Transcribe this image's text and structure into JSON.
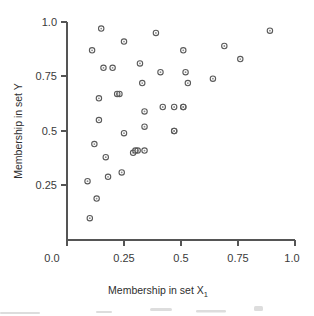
{
  "chart_data": {
    "type": "scatter",
    "title": "",
    "xlabel": "Membership in set X",
    "xlabel_subscript": "1",
    "ylabel": "Membership in set Y",
    "xlim": [
      0.0,
      1.0
    ],
    "ylim": [
      0.0,
      1.0
    ],
    "grid": false,
    "legend": null,
    "xticks": [
      0.0,
      0.25,
      0.5,
      0.75,
      1.0
    ],
    "xtick_labels": [
      "0.0",
      "0.25",
      "0.5",
      "0.75",
      "1.0"
    ],
    "yticks": [
      0.25,
      0.5,
      0.75,
      1.0
    ],
    "ytick_labels": [
      "0.25",
      "0.5",
      "0.75",
      "1.0"
    ],
    "marker": "open-circle",
    "marker_color": "#5a5a5a",
    "n_points": 40,
    "x": [
      0.11,
      0.09,
      0.15,
      0.16,
      0.14,
      0.22,
      0.25,
      0.25,
      0.24,
      0.32,
      0.33,
      0.34,
      0.34,
      0.34,
      0.31,
      0.39,
      0.41,
      0.42,
      0.46,
      0.47,
      0.51,
      0.52,
      0.53,
      0.54,
      0.64,
      0.69,
      0.76,
      0.89,
      0.12,
      0.14,
      0.1,
      0.13,
      0.17,
      0.18,
      0.2,
      0.23,
      0.29,
      0.3,
      0.47,
      0.51
    ],
    "y": [
      0.87,
      0.27,
      0.97,
      0.79,
      0.65,
      0.67,
      0.91,
      0.49,
      0.31,
      0.81,
      0.72,
      0.59,
      0.52,
      0.41,
      0.41,
      0.95,
      0.77,
      0.61,
      0.61,
      0.5,
      0.87,
      0.77,
      0.72,
      0.61,
      0.74,
      0.89,
      0.83,
      0.96,
      0.44,
      0.55,
      0.1,
      0.19,
      0.38,
      0.29,
      0.79,
      0.67,
      0.4,
      0.41,
      0.5,
      0.61
    ],
    "points": [
      {
        "x": 0.11,
        "y": 0.87
      },
      {
        "x": 0.09,
        "y": 0.27
      },
      {
        "x": 0.15,
        "y": 0.97
      },
      {
        "x": 0.16,
        "y": 0.79
      },
      {
        "x": 0.14,
        "y": 0.65
      },
      {
        "x": 0.22,
        "y": 0.67
      },
      {
        "x": 0.25,
        "y": 0.91
      },
      {
        "x": 0.25,
        "y": 0.49
      },
      {
        "x": 0.24,
        "y": 0.31
      },
      {
        "x": 0.32,
        "y": 0.81
      },
      {
        "x": 0.33,
        "y": 0.72
      },
      {
        "x": 0.34,
        "y": 0.59
      },
      {
        "x": 0.34,
        "y": 0.52
      },
      {
        "x": 0.34,
        "y": 0.41
      },
      {
        "x": 0.31,
        "y": 0.41
      },
      {
        "x": 0.39,
        "y": 0.95
      },
      {
        "x": 0.41,
        "y": 0.77
      },
      {
        "x": 0.42,
        "y": 0.61
      },
      {
        "x": 0.47,
        "y": 0.61
      },
      {
        "x": 0.47,
        "y": 0.5
      },
      {
        "x": 0.51,
        "y": 0.87
      },
      {
        "x": 0.52,
        "y": 0.77
      },
      {
        "x": 0.53,
        "y": 0.72
      },
      {
        "x": 0.51,
        "y": 0.61
      },
      {
        "x": 0.64,
        "y": 0.74
      },
      {
        "x": 0.69,
        "y": 0.89
      },
      {
        "x": 0.76,
        "y": 0.83
      },
      {
        "x": 0.89,
        "y": 0.96
      },
      {
        "x": 0.12,
        "y": 0.44
      },
      {
        "x": 0.14,
        "y": 0.55
      },
      {
        "x": 0.1,
        "y": 0.1
      },
      {
        "x": 0.13,
        "y": 0.19
      },
      {
        "x": 0.17,
        "y": 0.38
      },
      {
        "x": 0.18,
        "y": 0.29
      },
      {
        "x": 0.2,
        "y": 0.79
      },
      {
        "x": 0.23,
        "y": 0.67
      },
      {
        "x": 0.29,
        "y": 0.4
      },
      {
        "x": 0.3,
        "y": 0.41
      },
      {
        "x": 0.47,
        "y": 0.5
      },
      {
        "x": 0.51,
        "y": 0.61
      }
    ]
  },
  "axes": {
    "x_title": "Membership in set X",
    "x_title_sub": "1",
    "y_title": "Membership in set Y",
    "x_tick_labels": [
      "0.0",
      "0.25",
      "0.5",
      "0.75",
      "1.0"
    ],
    "y_tick_labels": [
      "1.0",
      "0.75",
      "0.5",
      "0.25"
    ]
  }
}
